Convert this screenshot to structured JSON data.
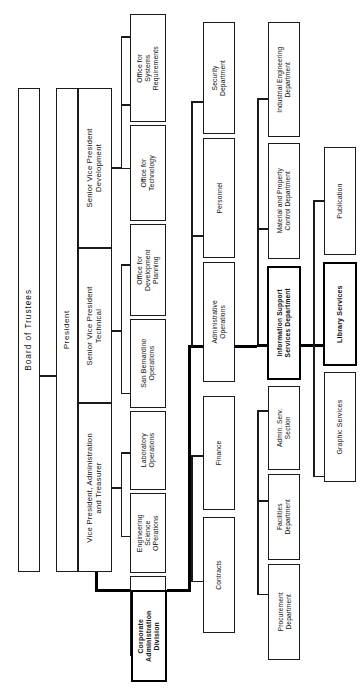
{
  "chart_title": "Organization Chart",
  "orientation": "rotated-90-ccw",
  "nodes": {
    "board": "Board of Trustees",
    "president": "President",
    "vp_admin": "Vice President, Administration and Treasurer",
    "svp_technical": "Senior Vice President Technical",
    "svp_development": "Senior Vice President Development",
    "corporate_admin": "Corporate Administration Division",
    "systems_eng_ops": "Systems Engineering Operations",
    "eng_science_ops": "Engineering Science OPerations",
    "laboratory_ops": "Laboratory Operations",
    "san_bernardino": "San Bernardino Operations",
    "office_dev_planning": "Office for Development Planning",
    "office_technology": "Office for Technology",
    "office_sys_req": "Office for Systems Requirements",
    "contracts": "Contracts",
    "finance": "Finance",
    "administrative_ops": "Administrative Operations",
    "personnel": "Personnel",
    "security_dept": "Security Department",
    "procurement_dept": "Procurement Department",
    "facilities_dept": "Facilities Department",
    "admin_serv_section": "Admin. Serv. Section",
    "info_support_services": "Information Support Services Department",
    "material_property": "Material and Property Control Department",
    "industrial_eng": "Industrial Engineering Department",
    "graphic_services": "Graphic Services",
    "library_services": "Library Services",
    "publication": "Publication"
  },
  "highlighted": [
    "Information Support Services Department",
    "Library Services"
  ],
  "colors": {
    "line": "#1a1a1a",
    "emphasis_line": "#000000",
    "box_fill": "#ffffff",
    "text": "#111111"
  },
  "hierarchy": {
    "root": "Board of Trustees",
    "levels": [
      [
        "Board of Trustees"
      ],
      [
        "President"
      ],
      [
        "Vice President, Administration and Treasurer",
        "Senior Vice President Technical",
        "Senior Vice President Development"
      ],
      [
        "Corporate Administration Division",
        "Systems Engineering Operations",
        "Engineering Science OPerations",
        "Laboratory Operations",
        "San Bernardino Operations",
        "Office for Development Planning",
        "Office for Technology",
        "Office for Systems Requirements"
      ],
      [
        "Contracts",
        "Finance",
        "Administrative Operations",
        "Personnel",
        "Security Department"
      ],
      [
        "Procurement Department",
        "Facilities Department",
        "Admin. Serv. Section",
        "Information Support Services Department",
        "Material and Property Control Department",
        "Industrial Engineering Department"
      ],
      [
        "Graphic Services",
        "Library Services",
        "Publication"
      ]
    ]
  }
}
